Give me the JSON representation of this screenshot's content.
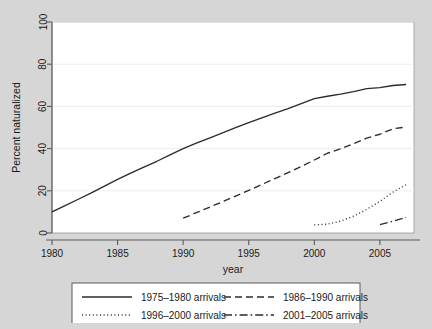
{
  "chart_data": {
    "type": "line",
    "title": "",
    "xlabel": "year",
    "ylabel": "Percent naturalized",
    "xlim": [
      1980,
      2007.6
    ],
    "ylim": [
      0,
      100
    ],
    "grid": true,
    "legend_position": "bottom",
    "xticks": [
      "1980",
      "1985",
      "1990",
      "1995",
      "2000",
      "2005"
    ],
    "xtick_values": [
      1980,
      1985,
      1990,
      1995,
      2000,
      2005
    ],
    "yticks": [
      "0",
      "20",
      "40",
      "60",
      "80",
      "100"
    ],
    "ytick_values": [
      0,
      20,
      40,
      60,
      80,
      100
    ],
    "series": [
      {
        "name": "1975–1980 arrivals",
        "style": "solid",
        "color": "#2b2b2b",
        "x": [
          1980,
          1981,
          1982,
          1983,
          1984,
          1985,
          1986,
          1987,
          1988,
          1989,
          1990,
          1991,
          1992,
          1993,
          1994,
          1995,
          1996,
          1997,
          1998,
          1999,
          2000,
          2001,
          2002,
          2003,
          2004,
          2005,
          2006,
          2007
        ],
        "values": [
          10.0,
          13.0,
          16.0,
          19.0,
          22.2,
          25.4,
          28.4,
          31.2,
          34.0,
          37.0,
          40.0,
          42.6,
          45.0,
          47.4,
          49.9,
          52.3,
          54.6,
          56.8,
          58.9,
          61.3,
          63.7,
          64.8,
          65.8,
          67.0,
          68.4,
          68.9,
          69.9,
          70.4
        ]
      },
      {
        "name": "1986–1990 arrivals",
        "style": "dashed",
        "color": "#2b2b2b",
        "x": [
          1990,
          1991,
          1992,
          1993,
          1994,
          1995,
          1996,
          1997,
          1998,
          1999,
          2000,
          2001,
          2002,
          2003,
          2004,
          2005,
          2006,
          2007
        ],
        "values": [
          7.0,
          9.6,
          12.2,
          14.8,
          17.5,
          20.2,
          23.0,
          25.8,
          28.6,
          31.5,
          34.6,
          37.8,
          39.9,
          42.4,
          45.0,
          46.8,
          49.4,
          50.2
        ]
      },
      {
        "name": "1996–2000 arrivals",
        "style": "dotted",
        "color": "#2b2b2b",
        "x": [
          2000,
          2001,
          2002,
          2003,
          2004,
          2005,
          2006,
          2007
        ],
        "values": [
          3.8,
          4.2,
          5.6,
          8.0,
          11.2,
          15.0,
          19.4,
          22.9
        ]
      },
      {
        "name": "2001–2005 arrivals",
        "style": "dashdot",
        "color": "#2b2b2b",
        "x": [
          2005,
          2006,
          2007
        ],
        "values": [
          4.0,
          5.6,
          7.4
        ]
      }
    ]
  },
  "legend": {
    "entries": [
      {
        "label": "1975–1980 arrivals",
        "style": "solid"
      },
      {
        "label": "1986–1990 arrivals",
        "style": "dashed"
      },
      {
        "label": "1996–2000 arrivals",
        "style": "dotted"
      },
      {
        "label": "2001–2005 arrivals",
        "style": "dashdot"
      }
    ]
  },
  "colors": {
    "figure_background": "#d6d6d6",
    "plot_background": "#ffffff",
    "line": "#2b2b2b",
    "grid": "#ededed",
    "axis": "#5a5a5a",
    "text": "#1a1a1a"
  }
}
